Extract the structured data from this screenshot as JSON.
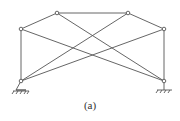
{
  "figure": {
    "caption": "(a)",
    "type": "truss-structure",
    "line_color": "#555555",
    "nodes": [
      {
        "id": "top-left",
        "x": 57,
        "y": 13
      },
      {
        "id": "top-right",
        "x": 128,
        "y": 13
      },
      {
        "id": "mid-left",
        "x": 21,
        "y": 29
      },
      {
        "id": "mid-right",
        "x": 164,
        "y": 29
      },
      {
        "id": "bottom-left",
        "x": 21,
        "y": 81
      },
      {
        "id": "bottom-right",
        "x": 164,
        "y": 81
      }
    ],
    "members": [
      [
        "top-left",
        "top-right"
      ],
      [
        "mid-left",
        "top-left"
      ],
      [
        "top-right",
        "mid-right"
      ],
      [
        "mid-left",
        "bottom-left"
      ],
      [
        "mid-right",
        "bottom-right"
      ],
      [
        "top-left",
        "bottom-right"
      ],
      [
        "mid-left",
        "bottom-right"
      ],
      [
        "top-right",
        "bottom-left"
      ],
      [
        "mid-right",
        "bottom-left"
      ]
    ],
    "supports": [
      {
        "node": "bottom-left",
        "kind": "pin"
      },
      {
        "node": "bottom-right",
        "kind": "roller"
      }
    ]
  }
}
